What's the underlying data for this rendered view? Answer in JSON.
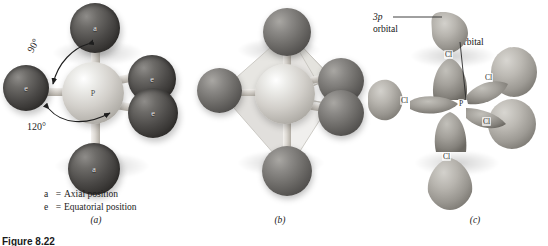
{
  "figure": {
    "bottom_caption": "Figure 8.22",
    "background_color": "#ffffff"
  },
  "panels": [
    {
      "id": "a",
      "caption": "(a)",
      "kind": "ball-and-stick",
      "molecule": "PCl5",
      "geometry": "trigonal bipyramidal",
      "center_atom_label": "P",
      "annotations": [
        {
          "name": "angle-90",
          "text": "90°"
        },
        {
          "name": "angle-120",
          "text": "120°"
        }
      ],
      "atom_labels": {
        "axial": "a",
        "equatorial": "e"
      },
      "legend": [
        {
          "key": "a",
          "eq": "=",
          "text": "Axial position"
        },
        {
          "key": "e",
          "eq": "=",
          "text": "Equatorial position"
        }
      ]
    },
    {
      "id": "b",
      "caption": "(b)",
      "kind": "polyhedron-overlay",
      "shape": "trigonal bipyramid"
    },
    {
      "id": "c",
      "caption": "(c)",
      "kind": "orbital-overlap",
      "labels": {
        "p_orbital_line1": "3p",
        "p_orbital_line2": "orbital",
        "hybrid_orbital": "sp3d orbital"
      },
      "atom_tags": {
        "center": "P",
        "ligand": "Cl"
      }
    }
  ],
  "colors": {
    "chlorine_dark": "#4d4b49",
    "chlorine_mid": "#6d6b68",
    "phosphorus_light": "#d2cfca",
    "orbital_gray": "#b6b3ad",
    "text": "#1a1a1a"
  }
}
